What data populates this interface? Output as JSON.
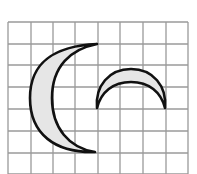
{
  "diagram": {
    "type": "grid-figure",
    "grid": {
      "columns": 8,
      "rows": 7,
      "x_lines": [
        8,
        31,
        53,
        75,
        98,
        120,
        143,
        166,
        188
      ],
      "y_lines": [
        22,
        44,
        65,
        87,
        109,
        131,
        153,
        174
      ],
      "line_color": "#9a9a9a"
    },
    "shapes": [
      {
        "name": "large-crescent",
        "orientation": "opening-right",
        "top_tip": [
          97,
          44
        ],
        "bottom_tip": [
          95,
          152
        ],
        "outer_leftmost": [
          30,
          98
        ],
        "inner_leftmost": [
          52,
          98
        ],
        "fill": "#e6e6e6",
        "stroke": "#111111"
      },
      {
        "name": "small-crescent",
        "orientation": "opening-down",
        "left_tip": [
          97,
          108
        ],
        "right_tip": [
          165,
          108
        ],
        "outer_top": [
          131,
          69
        ],
        "inner_top": [
          131,
          82
        ],
        "fill": "#e6e6e6",
        "stroke": "#111111"
      }
    ]
  }
}
